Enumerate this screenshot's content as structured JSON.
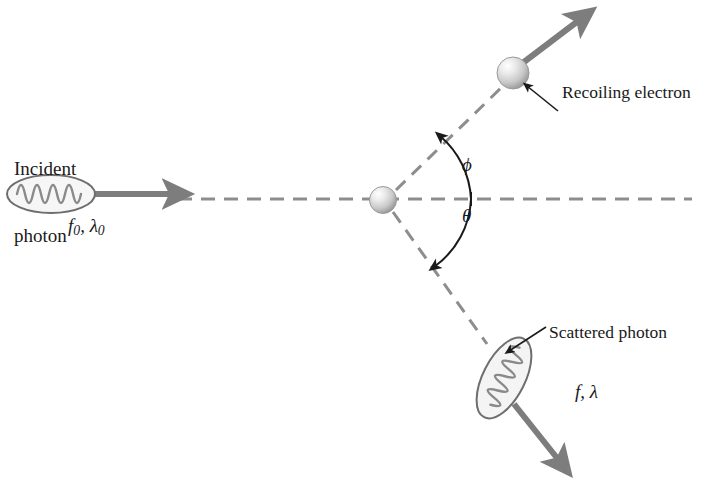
{
  "figure": {
    "background_color": "#ffffff"
  },
  "labels": {
    "incident_photon_line1": "Incident",
    "incident_photon_line2": "photon",
    "incident_photon_symbols": "f0, λ0",
    "incident_freq_symbol": "f",
    "incident_freq_sub": "0",
    "incident_lambda_symbol": "λ",
    "incident_lambda_sub": "0",
    "recoiling_electron": "Recoiling electron",
    "scattered_photon": "Scattered photon",
    "scattered_symbols": "f, λ",
    "angle_phi": "ϕ",
    "angle_theta": "θ",
    "comma": ", "
  },
  "colors": {
    "arrow_gray": "#7d7d7d",
    "dashed_gray": "#8d8d8d",
    "outline_gray": "#6e6e6e",
    "wave_gray": "#8a8a8a",
    "text_black": "#1a1a1a",
    "sphere_light": "#fdfdfd",
    "sphere_mid": "#d2d2d2",
    "sphere_dark": "#8e8e8e",
    "pointer_black": "#1a1a1a",
    "photon_fill": "#f4f4f4"
  },
  "geometry": {
    "scatter_center": {
      "x": 383,
      "y": 200
    },
    "incident_photon_ellipse": {
      "cx": 51,
      "cy": 194,
      "rx": 44,
      "ry": 19
    },
    "incident_arrow": {
      "x1": 92,
      "y1": 194,
      "x2": 184,
      "y2": 194
    },
    "horizontal_dashed": {
      "x1": 178,
      "y1": 199,
      "x2": 692,
      "y2": 199
    },
    "electron_sphere": {
      "cx": 513,
      "cy": 73,
      "r": 16
    },
    "electron_dashed": {
      "x1": 396,
      "y1": 192,
      "x2": 505,
      "y2": 85
    },
    "electron_arrow": {
      "x1": 521,
      "y1": 64,
      "x2": 588,
      "y2": 13
    },
    "scattered_dashed": {
      "x1": 394,
      "y1": 211,
      "x2": 486,
      "y2": 341
    },
    "scattered_photon_ellipse": {
      "cx": 504,
      "cy": 378,
      "rx": 21,
      "ry": 44,
      "rotation_deg": 27
    },
    "scattered_arrow": {
      "x1": 517,
      "y1": 408,
      "x2": 567,
      "y2": 470
    },
    "phi_arc_radius": 88,
    "theta_arc_radius": 88,
    "recoil_pointer": {
      "x1": 556,
      "y1": 109,
      "x2": 524,
      "y2": 83
    },
    "scatter_pointer": {
      "x1": 543,
      "y1": 329,
      "x2": 506,
      "y2": 353
    }
  },
  "elements": {
    "incident_wave_cycles": 5,
    "scattered_wave_cycles": 5
  }
}
